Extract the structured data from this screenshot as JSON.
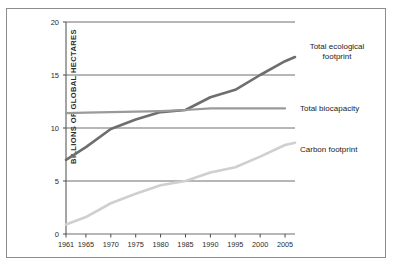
{
  "figure": {
    "top_caption": "",
    "background": "#ffffff",
    "frame_color": "#8d8d8d"
  },
  "chart_data": {
    "type": "line",
    "title": "",
    "xlabel": "",
    "ylabel": "BILLIONS OF GLOBAL HECTARES",
    "xlim": [
      1961,
      2007
    ],
    "ylim": [
      0,
      20
    ],
    "grid": true,
    "grid_axis": "y",
    "legend_position": "right-inline",
    "x_tick_labels": [
      "1961",
      "1965",
      "1970",
      "1975",
      "1980",
      "1985",
      "1990",
      "1995",
      "2000",
      "2005"
    ],
    "x_tick_values": [
      1961,
      1965,
      1970,
      1975,
      1980,
      1985,
      1990,
      1995,
      2000,
      2005
    ],
    "y_tick_labels": [
      "0",
      "5",
      "10",
      "15",
      "20"
    ],
    "y_tick_values": [
      0,
      5,
      10,
      15,
      20
    ],
    "series": [
      {
        "name": "Total ecological footprint",
        "color": "#6e6e6e",
        "width": 2.6,
        "x": [
          1961,
          1965,
          1970,
          1975,
          1980,
          1985,
          1990,
          1995,
          2000,
          2005,
          2007
        ],
        "values": [
          7.0,
          8.2,
          9.9,
          10.8,
          11.5,
          11.7,
          12.9,
          13.6,
          15.0,
          16.3,
          16.7
        ]
      },
      {
        "name": "Total biocapacity",
        "color": "#9a9a9a",
        "width": 2.2,
        "x": [
          1961,
          1965,
          1970,
          1975,
          1980,
          1985,
          1990,
          1995,
          2000,
          2005
        ],
        "values": [
          11.4,
          11.45,
          11.5,
          11.55,
          11.6,
          11.7,
          11.85,
          11.85,
          11.85,
          11.85
        ]
      },
      {
        "name": "Carbon footprint",
        "color": "#cfcfcf",
        "width": 2.6,
        "x": [
          1961,
          1965,
          1970,
          1975,
          1980,
          1985,
          1990,
          1995,
          2000,
          2005,
          2007
        ],
        "values": [
          0.9,
          1.6,
          2.9,
          3.8,
          4.6,
          5.0,
          5.8,
          6.3,
          7.3,
          8.4,
          8.6
        ]
      }
    ],
    "annotations": [
      {
        "text": "Total ecological footprint",
        "for_series": "Total ecological footprint"
      },
      {
        "text": "Total biocapacity",
        "for_series": "Total biocapacity"
      },
      {
        "text": "Carbon footprint",
        "for_series": "Carbon footprint"
      }
    ]
  }
}
